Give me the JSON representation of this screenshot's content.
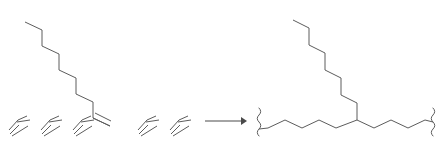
{
  "scheme": {
    "title": "Olefin oligomerization reaction scheme",
    "background_color": "#ffffff",
    "bond_color": "#5c5c5c",
    "arrow_color": "#4a4a4a",
    "canvas": {
      "width": 441,
      "height": 141
    },
    "reactants": {
      "label": "reactants",
      "long_alkene": {
        "name": "1-dodecene",
        "description": "long zigzag alkyl chain descending left-to-right ending in a terminal double bond",
        "vertex_count": 12,
        "terminal_double_bond": true,
        "points": "25,22 42,30 42,46 59,54 59,70 76,78 76,94 93,102 93,118 110,126",
        "double_bond_offset": "99,114 122,126"
      },
      "small_alkenes": [
        {
          "name": "ethylene-unit-1",
          "points": "9,130 18,120 27,116",
          "double_offset": "11,133 29,119"
        },
        {
          "name": "ethylene-unit-2",
          "points": "41,130 50,120 59,116",
          "double_offset": "43,133 61,119"
        },
        {
          "name": "ethylene-unit-3",
          "points": "73,130 82,120 91,116",
          "double_offset": "75,133 93,119"
        },
        {
          "name": "ethylene-unit-4",
          "points": "138,130 147,120 156,116",
          "double_offset": "140,133 158,119"
        },
        {
          "name": "ethylene-unit-5",
          "points": "170,130 179,120 188,116",
          "double_offset": "172,133 190,119"
        }
      ]
    },
    "arrow": {
      "name": "reaction-arrow",
      "direction": "right",
      "x_start": 205,
      "x_end": 246,
      "y": 121,
      "label": ""
    },
    "product": {
      "label": "product",
      "name": "branched polyethylene segment",
      "description": "polymer backbone with wavy continuation bonds at both ends and a long pendant alkyl branch rising from the central branch carbon",
      "backbone_points": "268,128 285,120 302,128 319,120 336,128 357,120 374,128 391,120 408,128 425,120",
      "branch_points": "357,120 357,103 341,95 341,78 325,70 325,53 309,45 309,28 293,20",
      "branch_point": {
        "x": 357,
        "y": 120
      },
      "left_squiggle": {
        "name": "left-polymer-continuation",
        "x": 259,
        "y_top": 108,
        "y_bottom": 136,
        "amplitude": 3.5,
        "waves": 4
      },
      "right_squiggle": {
        "name": "right-polymer-continuation",
        "x": 433,
        "y_top": 108,
        "y_bottom": 136,
        "amplitude": 3.5,
        "waves": 4
      }
    }
  },
  "chart_data": {
    "type": "diagram"
  }
}
